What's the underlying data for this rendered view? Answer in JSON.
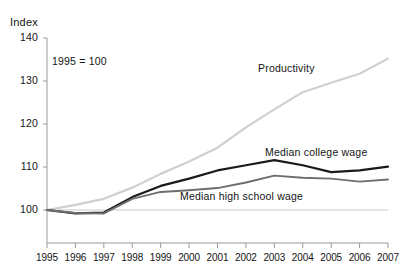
{
  "chart_data": {
    "type": "line",
    "title": "",
    "subtitle": "",
    "annotation": "1995 = 100",
    "ylabel": "Index",
    "xlabel": "",
    "ylim": [
      100,
      140
    ],
    "yticks": [
      "100",
      "110",
      "120",
      "130",
      "140"
    ],
    "ytick_values": [
      100,
      110,
      120,
      130,
      140
    ],
    "grid": false,
    "baseline_value": 100,
    "legend_position": "inline-labels",
    "x": [
      1995,
      1996,
      1997,
      1998,
      1999,
      2000,
      2001,
      2002,
      2003,
      2004,
      2005,
      2006,
      2007
    ],
    "xtick_labels": [
      "1995",
      "1996",
      "1997",
      "1998",
      "1999",
      "2000",
      "2001",
      "2002",
      "2003",
      "2004",
      "2005",
      "2006",
      "2007"
    ],
    "series": [
      {
        "name": "Productivity",
        "color": "#cfcfcf",
        "values": [
          100.0,
          101.2,
          102.6,
          105.2,
          108.4,
          111.3,
          114.5,
          119.2,
          123.4,
          127.4,
          129.6,
          131.7,
          135.2
        ]
      },
      {
        "name": "Median college wage",
        "color": "#1a1a1a",
        "values": [
          100.0,
          99.2,
          99.4,
          103.0,
          105.6,
          107.3,
          109.2,
          110.4,
          111.6,
          110.4,
          108.8,
          109.2,
          110.1
        ]
      },
      {
        "name": "Median high school wage",
        "color": "#6e6e6e",
        "values": [
          100.0,
          99.3,
          99.2,
          102.6,
          104.2,
          104.6,
          105.1,
          106.4,
          108.0,
          107.5,
          107.3,
          106.6,
          107.1
        ]
      }
    ],
    "series_label_positions": [
      {
        "name": "Productivity",
        "x": 258,
        "y": 62
      },
      {
        "name": "Median college wage",
        "x": 265,
        "y": 146
      },
      {
        "name": "Median high school wage",
        "x": 180,
        "y": 190
      }
    ],
    "axis_color": "#9a9a9a",
    "text_color": "#141414"
  }
}
